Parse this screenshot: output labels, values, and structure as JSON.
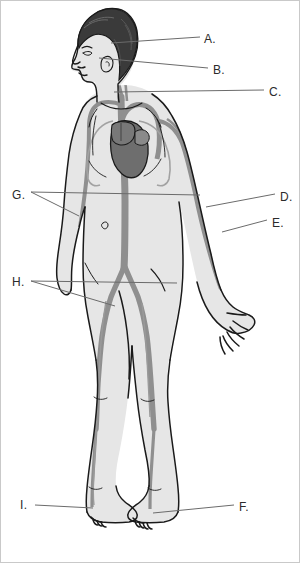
{
  "figure": {
    "background_color": "#ffffff",
    "border_color": "#c9c9c9",
    "outline_color": "#1a1a1a",
    "skin_fill": "#e6e6e6",
    "vessel_color": "#8f8f8f",
    "heart_color": "#6e6e6e",
    "hair_color": "#3a3a3a",
    "leader_line_color": "#6b6b6b"
  },
  "labels": [
    {
      "id": "A",
      "text": "A.",
      "x": 203,
      "y": 32,
      "side": "right",
      "forked": false
    },
    {
      "id": "B",
      "text": "B.",
      "x": 212,
      "y": 63,
      "side": "right",
      "forked": false
    },
    {
      "id": "C",
      "text": "C.",
      "x": 268,
      "y": 85,
      "side": "right",
      "forked": false
    },
    {
      "id": "D",
      "text": "D.",
      "x": 279,
      "y": 190,
      "side": "right",
      "forked": false
    },
    {
      "id": "E",
      "text": "E.",
      "x": 271,
      "y": 216,
      "side": "right",
      "forked": false
    },
    {
      "id": "F",
      "text": "F.",
      "x": 238,
      "y": 500,
      "side": "right",
      "forked": false
    },
    {
      "id": "G",
      "text": "G.",
      "x": 11,
      "y": 188,
      "side": "left",
      "forked": true
    },
    {
      "id": "H",
      "text": "H.",
      "x": 11,
      "y": 275,
      "side": "left",
      "forked": true
    },
    {
      "id": "I",
      "text": "I.",
      "x": 19,
      "y": 498,
      "side": "left",
      "forked": false
    }
  ],
  "leader_lines": [
    {
      "label": "A",
      "points": "110,42 199,36"
    },
    {
      "label": "B",
      "points": "98,57 207,67"
    },
    {
      "label": "C",
      "points": "113,91 263,89"
    },
    {
      "label": "D",
      "points": "205,206 274,193"
    },
    {
      "label": "E",
      "points": "221,231 266,219"
    },
    {
      "label": "F",
      "points": "152,512 233,504"
    },
    {
      "label": "G1",
      "points": "30,191 199,194"
    },
    {
      "label": "G2",
      "points": "30,191 78,215"
    },
    {
      "label": "H1",
      "points": "30,280 176,282"
    },
    {
      "label": "H2",
      "points": "30,280 114,305"
    },
    {
      "label": "I",
      "points": "34,504 92,507"
    }
  ]
}
